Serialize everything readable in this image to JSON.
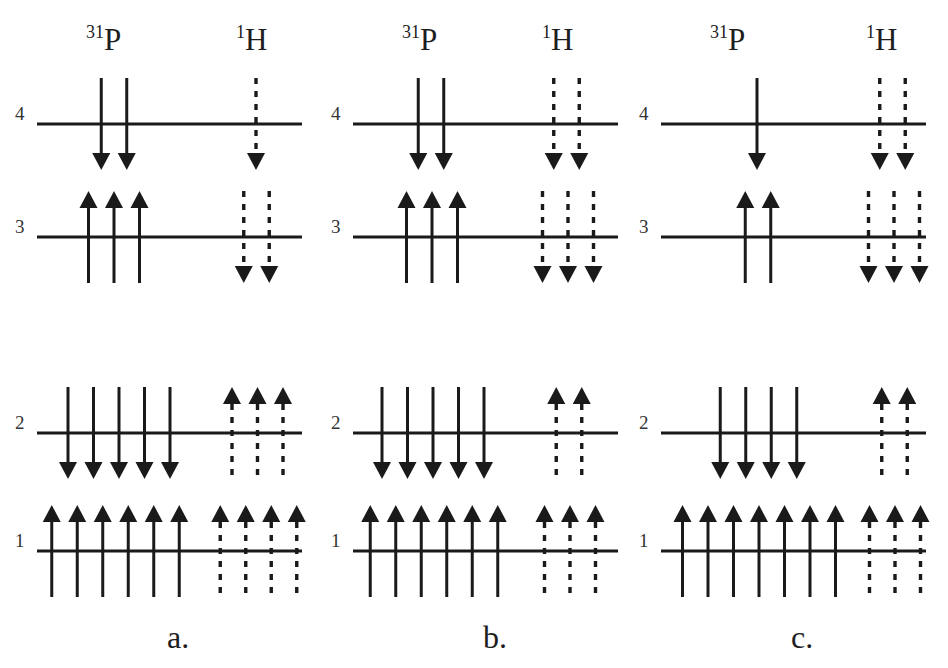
{
  "nuclei": {
    "p": {
      "mass": "31",
      "symbol": "P"
    },
    "h": {
      "mass": "1",
      "symbol": "H"
    }
  },
  "level_labels": [
    "1",
    "2",
    "3",
    "4"
  ],
  "arrow_legend": {
    "p_style": "solid",
    "h_style": "dashed"
  },
  "panels": [
    {
      "label": "a.",
      "levels": [
        {
          "level": "4",
          "p": {
            "count": 2,
            "dir": "down"
          },
          "h": {
            "count": 1,
            "dir": "down"
          }
        },
        {
          "level": "3",
          "p": {
            "count": 3,
            "dir": "up"
          },
          "h": {
            "count": 2,
            "dir": "down"
          }
        },
        {
          "level": "2",
          "p": {
            "count": 5,
            "dir": "down"
          },
          "h": {
            "count": 3,
            "dir": "up"
          }
        },
        {
          "level": "1",
          "p": {
            "count": 6,
            "dir": "up"
          },
          "h": {
            "count": 4,
            "dir": "up"
          }
        }
      ]
    },
    {
      "label": "b.",
      "levels": [
        {
          "level": "4",
          "p": {
            "count": 2,
            "dir": "down"
          },
          "h": {
            "count": 2,
            "dir": "down"
          }
        },
        {
          "level": "3",
          "p": {
            "count": 3,
            "dir": "up"
          },
          "h": {
            "count": 3,
            "dir": "down"
          }
        },
        {
          "level": "2",
          "p": {
            "count": 5,
            "dir": "down"
          },
          "h": {
            "count": 2,
            "dir": "up"
          }
        },
        {
          "level": "1",
          "p": {
            "count": 6,
            "dir": "up"
          },
          "h": {
            "count": 3,
            "dir": "up"
          }
        }
      ]
    },
    {
      "label": "c.",
      "levels": [
        {
          "level": "4",
          "p": {
            "count": 1,
            "dir": "down"
          },
          "h": {
            "count": 2,
            "dir": "down"
          }
        },
        {
          "level": "3",
          "p": {
            "count": 2,
            "dir": "up"
          },
          "h": {
            "count": 3,
            "dir": "down"
          }
        },
        {
          "level": "2",
          "p": {
            "count": 4,
            "dir": "down"
          },
          "h": {
            "count": 2,
            "dir": "up"
          }
        },
        {
          "level": "1",
          "p": {
            "count": 7,
            "dir": "up"
          },
          "h": {
            "count": 3,
            "dir": "up"
          }
        }
      ]
    }
  ]
}
